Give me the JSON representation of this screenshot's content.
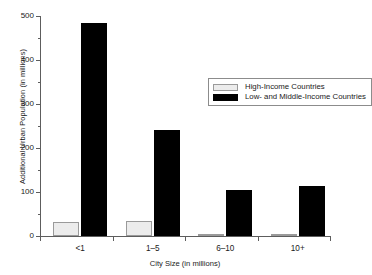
{
  "chart_data": {
    "type": "bar",
    "title": "",
    "xlabel": "City Size (in millions)",
    "ylabel": "Additional Urban Population (in millions)",
    "categories": [
      "<1",
      "1–5",
      "6–10",
      "10+"
    ],
    "series": [
      {
        "name": "High-Income Countries",
        "color": "#ececec",
        "values": [
          31,
          33,
          2,
          2
        ]
      },
      {
        "name": "Low- and Middle-Income Countries",
        "color": "#000000",
        "values": [
          483,
          241,
          104,
          113
        ]
      }
    ],
    "ylim": [
      0,
      500
    ],
    "y_ticks": [
      0,
      100,
      200,
      300,
      400,
      500
    ],
    "y_tick_labels": [
      "0",
      "100",
      "200",
      "300",
      "400",
      "500"
    ],
    "y_minor_ticks": [
      50,
      150,
      250,
      350,
      450
    ],
    "grid": false,
    "legend_position": "upper center",
    "axis_color": "#5d5d5d"
  },
  "legend": {
    "entries": [
      {
        "label": "High-Income Countries",
        "swatch": "light-swatch"
      },
      {
        "label": "Low- and Middle-Income Countries",
        "swatch": "dark-swatch"
      }
    ]
  }
}
